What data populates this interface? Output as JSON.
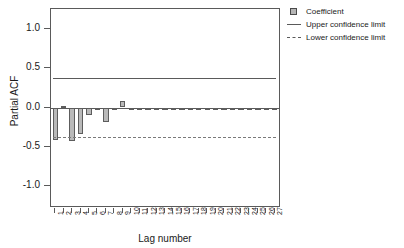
{
  "chart_data": {
    "type": "bar",
    "title": "",
    "subtitle": "",
    "xlabel": "Lag number",
    "ylabel": "Partial ACF",
    "categories": [
      "1",
      "2",
      "3",
      "4",
      "5",
      "6",
      "7",
      "8",
      "9",
      "10",
      "11",
      "12",
      "13",
      "14",
      "15",
      "16",
      "17",
      "18",
      "19",
      "20",
      "21",
      "22",
      "23",
      "24",
      "25",
      "26",
      "27"
    ],
    "values": [
      -0.41,
      0.02,
      -0.43,
      -0.33,
      -0.09,
      -0.02,
      -0.18,
      -0.01,
      0.08,
      -0.03,
      -0.01,
      -0.02,
      -0.01,
      -0.01,
      -0.03,
      -0.01,
      -0.02,
      -0.01,
      -0.02,
      -0.02,
      -0.01,
      -0.02,
      -0.02,
      -0.02,
      -0.01,
      -0.02,
      -0.02
    ],
    "series": [
      {
        "name": "Coefficient",
        "values": [
          -0.41,
          0.02,
          -0.43,
          -0.33,
          -0.09,
          -0.02,
          -0.18,
          -0.01,
          0.08,
          -0.03,
          -0.01,
          -0.02,
          -0.01,
          -0.01,
          -0.03,
          -0.01,
          -0.02,
          -0.01,
          -0.02,
          -0.02,
          -0.01,
          -0.02,
          -0.02,
          -0.02,
          -0.01,
          -0.02,
          -0.02
        ]
      }
    ],
    "upper_confidence_limit": 0.38,
    "lower_confidence_limit": -0.38,
    "ylim": [
      -1.25,
      1.25
    ],
    "yticks": [
      "1.0",
      "0.5",
      "0.0",
      "-0.5",
      "-1.0"
    ],
    "ytick_values": [
      1.0,
      0.5,
      0.0,
      -0.5,
      -1.0
    ],
    "grid": false,
    "legend_position": "top-right"
  },
  "legend": {
    "items": [
      {
        "label": "Coefficient",
        "key": "filled-square-key",
        "color": "#b5b5b5"
      },
      {
        "label": "Upper confidence limit",
        "key": "solid-line-key",
        "color": "#5a5a5a"
      },
      {
        "label": "Lower confidence limit",
        "key": "dashed-line-key",
        "color": "#5a5a5a"
      }
    ]
  },
  "axes": {
    "x_title": "Lag number",
    "y_title": "Partial ACF"
  }
}
